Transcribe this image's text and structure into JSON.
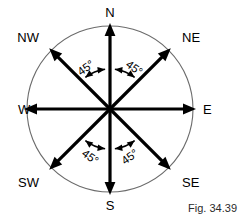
{
  "figure": {
    "caption": "Fig. 34.39",
    "center": {
      "x": 110,
      "y": 109
    },
    "radius": 83,
    "circle_color": "#6b6b6b",
    "ray_color": "#000000"
  },
  "directions": [
    {
      "key": "north",
      "label": "N",
      "angle_deg": 90,
      "label_x": 110,
      "label_y": 17,
      "anchor": "middle"
    },
    {
      "key": "northeast",
      "label": "NE",
      "angle_deg": 45,
      "label_x": 182,
      "label_y": 42,
      "anchor": "start"
    },
    {
      "key": "east",
      "label": "E",
      "angle_deg": 0,
      "label_x": 203,
      "label_y": 114,
      "anchor": "start"
    },
    {
      "key": "southeast",
      "label": "SE",
      "angle_deg": 315,
      "label_x": 182,
      "label_y": 187,
      "anchor": "start"
    },
    {
      "key": "south",
      "label": "S",
      "angle_deg": 270,
      "label_x": 110,
      "label_y": 210,
      "anchor": "middle"
    },
    {
      "key": "southwest",
      "label": "SW",
      "angle_deg": 225,
      "label_x": 39,
      "label_y": 187,
      "anchor": "end"
    },
    {
      "key": "west",
      "label": "W",
      "angle_deg": 180,
      "label_x": 18,
      "label_y": 114,
      "anchor": "start"
    },
    {
      "key": "northwest",
      "label": "NW",
      "angle_deg": 135,
      "label_x": 39,
      "label_y": 42,
      "anchor": "end"
    }
  ],
  "angles": [
    {
      "key": "angle-n-nw",
      "label": "45°",
      "between": [
        "NW",
        "N"
      ],
      "label_x": 88,
      "label_y": 71,
      "rotation": -36
    },
    {
      "key": "angle-n-ne",
      "label": "45°",
      "between": [
        "N",
        "NE"
      ],
      "label_x": 132,
      "label_y": 71,
      "rotation": 36
    },
    {
      "key": "angle-s-sw",
      "label": "45°",
      "between": [
        "SW",
        "S"
      ],
      "label_x": 88,
      "label_y": 160,
      "rotation": 36
    },
    {
      "key": "angle-s-se",
      "label": "45°",
      "between": [
        "S",
        "SE"
      ],
      "label_x": 132,
      "label_y": 160,
      "rotation": -36
    }
  ],
  "chart_data": {
    "type": "diagram",
    "title": "Fig. 34.39",
    "categories": [
      "N",
      "NE",
      "E",
      "SE",
      "S",
      "SW",
      "W",
      "NW"
    ],
    "bearings_deg": [
      0,
      45,
      90,
      135,
      180,
      225,
      270,
      315
    ],
    "angle_between_adjacent_deg": 45,
    "annotated_angles": [
      "45°",
      "45°",
      "45°",
      "45°"
    ]
  }
}
